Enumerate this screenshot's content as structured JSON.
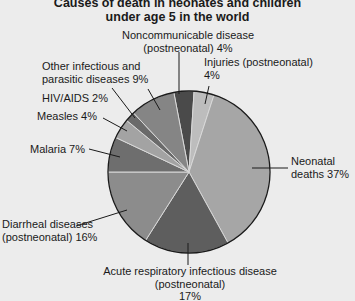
{
  "chart_data": {
    "type": "pie",
    "title": "Causes of death in neonates and children under age 5 in the world",
    "title_lines": [
      "Causes of death in neonates and children",
      "under age 5 in the world"
    ],
    "categories": [
      "Noncommunicable disease (postneonatal)",
      "Injuries (postneonatal)",
      "Neonatal deaths",
      "Acute respiratory infectious disease (postneonatal)",
      "Diarrheal diseases (postneonatal)",
      "Malaria",
      "Measles",
      "HIV/AIDS",
      "Other infectious and parasitic diseases"
    ],
    "values": [
      4,
      4,
      37,
      17,
      16,
      7,
      4,
      2,
      9
    ],
    "unit": "%",
    "colors": [
      "#4a4a4a",
      "#bdbdbd",
      "#a6a6a6",
      "#5e5e5e",
      "#8c8c8c",
      "#6e6e6e",
      "#a3a3a3",
      "#6a6a6a",
      "#858585"
    ],
    "legend": "none (direct labels)"
  },
  "labels": {
    "noncomm_1": "Noncommunicable disease",
    "noncomm_2": "(postneonatal) 4%",
    "injuries_1": "Injuries (postneonatal)",
    "injuries_2": "4%",
    "other_1": "Other infectious and",
    "other_2": "parasitic diseases 9%",
    "hiv": "HIV/AIDS 2%",
    "measles": "Measles 4%",
    "malaria": "Malaria 7%",
    "neonatal_1": "Neonatal",
    "neonatal_2": "deaths 37%",
    "diarrheal_1": "Diarrheal diseases",
    "diarrheal_2": "(postneonatal) 16%",
    "ari_1": "Acute respiratory infectious disease",
    "ari_2": "(postneonatal)",
    "ari_3": "17%"
  }
}
